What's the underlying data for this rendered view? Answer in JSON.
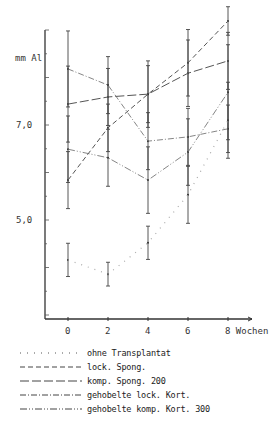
{
  "chart_data": {
    "type": "line",
    "title": "",
    "ylabel": "mm Al",
    "xlabel": "Wochen",
    "x": [
      0,
      2,
      4,
      6,
      8
    ],
    "x_tick_labels": [
      "0",
      "2",
      "4",
      "6",
      "8 Wochen"
    ],
    "y_tick_labels": [
      "7,0",
      "5,0"
    ],
    "y_ticks": [
      7.0,
      5.0
    ],
    "ylim": [
      2.9,
      9.0
    ],
    "xlim": [
      -1.15,
      9.2
    ],
    "grid": false,
    "legend_position": "bottom",
    "error_bars": true,
    "series": [
      {
        "name": "ohne Transplantat",
        "style": "dotted-sparse",
        "values": [
          4.16,
          3.86,
          4.52,
          5.53,
          7.1
        ],
        "err": [
          0.35,
          0.25,
          0.35,
          0.6,
          0.8
        ]
      },
      {
        "name": "lock. Spong.",
        "style": "dashed",
        "values": [
          5.84,
          6.94,
          7.65,
          8.31,
          9.19
        ],
        "err": [
          0.6,
          0.5,
          0.7,
          0.7,
          0.3
        ]
      },
      {
        "name": "komp. Spong. 200",
        "style": "long-dash",
        "values": [
          7.44,
          7.59,
          7.65,
          8.09,
          8.35
        ],
        "err": [
          0.8,
          0.6,
          0.6,
          0.7,
          0.6
        ]
      },
      {
        "name": "gehobelte lock. Kort.",
        "style": "dash-dot",
        "values": [
          8.18,
          7.84,
          6.66,
          6.75,
          6.92
        ],
        "err": [
          0.8,
          0.6,
          0.6,
          0.6,
          0.5
        ]
      },
      {
        "name": "gehobelte komp. Kort. 300",
        "style": "dash-dot-dot",
        "values": [
          6.49,
          6.31,
          5.84,
          6.43,
          7.69
        ],
        "err": [
          0.7,
          0.6,
          0.7,
          0.7,
          1.0
        ]
      }
    ]
  },
  "axis": {
    "y_unit": "mm Al",
    "y_tick_7": "7,0",
    "y_tick_5": "5,0",
    "x_ticks": [
      "0",
      "2",
      "4",
      "6",
      "8 Wochen"
    ]
  },
  "legend": [
    {
      "label": "ohne Transplantat",
      "dash": "1,6"
    },
    {
      "label": "lock. Spong.",
      "dash": "5,3"
    },
    {
      "label": "komp. Spong. 200",
      "dash": "9,3"
    },
    {
      "label": "gehobelte lock. Kort.",
      "dash": "6,2,1,2"
    },
    {
      "label": "gehobelte komp. Kort. 300",
      "dash": "7,2,1,2,1,2"
    }
  ]
}
